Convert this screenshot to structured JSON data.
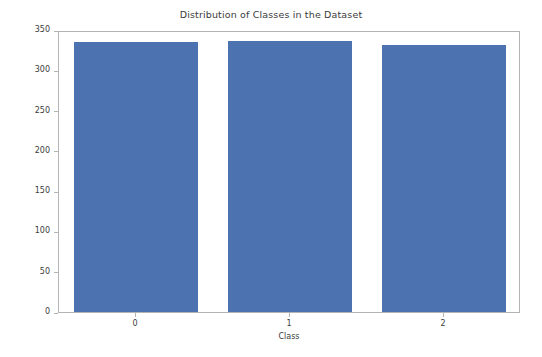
{
  "chart_data": {
    "type": "bar",
    "title": "Distribution of Classes in the Dataset",
    "xlabel": "Class",
    "ylabel": "Frequency",
    "categories": [
      "0",
      "1",
      "2"
    ],
    "values": [
      335,
      336,
      332
    ],
    "ylim": [
      0,
      350
    ],
    "yticks": [
      0,
      50,
      100,
      150,
      200,
      250,
      300,
      350
    ],
    "ytick_labels": [
      "0",
      "50",
      "100",
      "150",
      "200",
      "250",
      "300",
      "350"
    ],
    "xtick_labels": [
      "0",
      "1",
      "2"
    ],
    "grid": false,
    "legend": null,
    "bar_color": "#4c72b0",
    "axis_color": "#b4b4b4",
    "text_color": "#3b3b3b",
    "background_color": "#ffffff"
  }
}
